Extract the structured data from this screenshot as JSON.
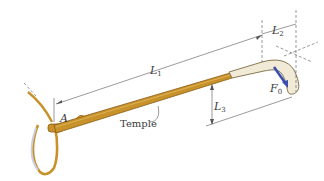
{
  "diagram": {
    "labels": {
      "point_a": "A",
      "temple": "Temple",
      "l1_main": "L",
      "l1_sub": "1",
      "l2_main": "L",
      "l2_sub": "2",
      "l3_main": "L",
      "l3_sub": "3",
      "force_main": "F",
      "force_sub": "0"
    },
    "colors": {
      "temple_gold": "#c8922a",
      "temple_gold_dark": "#8a5c14",
      "tip_ivory": "#f1ead6",
      "tip_outline": "#7a6a44",
      "force_arrow": "#3a4fb0",
      "dimension_line": "#555555",
      "lens_shadow": "#c9cfe0"
    }
  }
}
